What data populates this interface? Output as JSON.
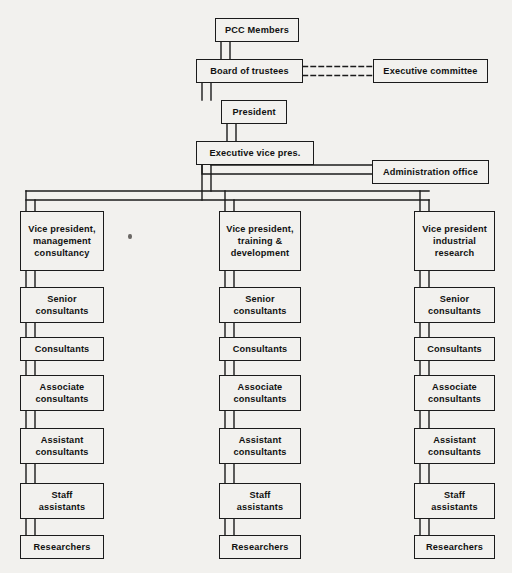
{
  "chart_data": {
    "type": "diagram",
    "diagram_kind": "organization-chart",
    "background_color": "#f2f1ee",
    "line_color": "#1b1b1b",
    "text_color": "#111111",
    "nodes": [
      {
        "id": "pcc_members",
        "label": "PCC Members",
        "x": 215,
        "y": 18,
        "w": 84,
        "h": 24
      },
      {
        "id": "board_trustees",
        "label": "Board of trustees",
        "x": 196,
        "y": 59,
        "w": 107,
        "h": 24
      },
      {
        "id": "exec_committee",
        "label": "Executive committee",
        "x": 373,
        "y": 59,
        "w": 115,
        "h": 24
      },
      {
        "id": "president",
        "label": "President",
        "x": 221,
        "y": 100,
        "w": 66,
        "h": 24
      },
      {
        "id": "exec_vice_pres",
        "label": "Executive vice pres.",
        "x": 196,
        "y": 141,
        "w": 118,
        "h": 24
      },
      {
        "id": "admin_office",
        "label": "Administration office",
        "x": 372,
        "y": 160,
        "w": 117,
        "h": 24
      },
      {
        "id": "vp_mgmt",
        "label": "Vice president,\nmanagement\nconsultancy",
        "x": 20,
        "y": 211,
        "w": 84,
        "h": 60
      },
      {
        "id": "vp_training",
        "label": "Vice president,\ntraining &\ndevelopment",
        "x": 219,
        "y": 211,
        "w": 82,
        "h": 60
      },
      {
        "id": "vp_research",
        "label": "Vice president\nindustrial\nresearch",
        "x": 414,
        "y": 211,
        "w": 81,
        "h": 60
      },
      {
        "id": "sc_l",
        "label": "Senior\nconsultants",
        "x": 20,
        "y": 287,
        "w": 84,
        "h": 36
      },
      {
        "id": "sc_m",
        "label": "Senior\nconsultants",
        "x": 219,
        "y": 287,
        "w": 82,
        "h": 36
      },
      {
        "id": "sc_r",
        "label": "Senior\nconsultants",
        "x": 414,
        "y": 287,
        "w": 81,
        "h": 36
      },
      {
        "id": "c_l",
        "label": "Consultants",
        "x": 20,
        "y": 337,
        "w": 84,
        "h": 24
      },
      {
        "id": "c_m",
        "label": "Consultants",
        "x": 219,
        "y": 337,
        "w": 82,
        "h": 24
      },
      {
        "id": "c_r",
        "label": "Consultants",
        "x": 414,
        "y": 337,
        "w": 81,
        "h": 24
      },
      {
        "id": "ac_l",
        "label": "Associate\nconsultants",
        "x": 20,
        "y": 375,
        "w": 84,
        "h": 36
      },
      {
        "id": "ac_m",
        "label": "Associate\nconsultants",
        "x": 219,
        "y": 375,
        "w": 82,
        "h": 36
      },
      {
        "id": "ac_r",
        "label": "Associate\nconsultants",
        "x": 414,
        "y": 375,
        "w": 81,
        "h": 36
      },
      {
        "id": "as_l",
        "label": "Assistant\nconsultants",
        "x": 20,
        "y": 428,
        "w": 84,
        "h": 36
      },
      {
        "id": "as_m",
        "label": "Assistant\nconsultants",
        "x": 219,
        "y": 428,
        "w": 82,
        "h": 36
      },
      {
        "id": "as_r",
        "label": "Assistant\nconsultants",
        "x": 414,
        "y": 428,
        "w": 81,
        "h": 36
      },
      {
        "id": "sa_l",
        "label": "Staff\nassistants",
        "x": 20,
        "y": 483,
        "w": 84,
        "h": 36
      },
      {
        "id": "sa_m",
        "label": "Staff\nassistants",
        "x": 219,
        "y": 483,
        "w": 82,
        "h": 36
      },
      {
        "id": "sa_r",
        "label": "Staff\nassistants",
        "x": 414,
        "y": 483,
        "w": 81,
        "h": 36
      },
      {
        "id": "r_l",
        "label": "Researchers",
        "x": 20,
        "y": 535,
        "w": 84,
        "h": 24
      },
      {
        "id": "r_m",
        "label": "Researchers",
        "x": 219,
        "y": 535,
        "w": 82,
        "h": 24
      },
      {
        "id": "r_r",
        "label": "Researchers",
        "x": 414,
        "y": 535,
        "w": 81,
        "h": 24
      }
    ],
    "connectors": [
      {
        "from": "pcc_members",
        "to": "board_trustees",
        "style": "ribbon-vertical"
      },
      {
        "from": "board_trustees",
        "to": "exec_committee",
        "style": "ribbon-horizontal-dashed"
      },
      {
        "from": "board_trustees",
        "to": "president",
        "style": "ribbon-vertical"
      },
      {
        "from": "president",
        "to": "exec_vice_pres",
        "style": "ribbon-vertical"
      },
      {
        "from": "exec_vice_pres",
        "to": "admin_office",
        "style": "ribbon-elbow"
      },
      {
        "from": "exec_vice_pres",
        "to": "vp_mgmt",
        "style": "ribbon-bus"
      },
      {
        "from": "exec_vice_pres",
        "to": "vp_training",
        "style": "ribbon-bus"
      },
      {
        "from": "exec_vice_pres",
        "to": "vp_research",
        "style": "ribbon-bus"
      },
      {
        "from": "vp_mgmt",
        "to": "sc_l",
        "style": "ribbon-vertical"
      },
      {
        "from": "sc_l",
        "to": "c_l",
        "style": "ribbon-vertical"
      },
      {
        "from": "c_l",
        "to": "ac_l",
        "style": "ribbon-vertical"
      },
      {
        "from": "ac_l",
        "to": "as_l",
        "style": "ribbon-vertical"
      },
      {
        "from": "as_l",
        "to": "sa_l",
        "style": "ribbon-vertical"
      },
      {
        "from": "sa_l",
        "to": "r_l",
        "style": "ribbon-vertical"
      },
      {
        "from": "vp_training",
        "to": "sc_m",
        "style": "ribbon-vertical"
      },
      {
        "from": "sc_m",
        "to": "c_m",
        "style": "ribbon-vertical"
      },
      {
        "from": "c_m",
        "to": "ac_m",
        "style": "ribbon-vertical"
      },
      {
        "from": "ac_m",
        "to": "as_m",
        "style": "ribbon-vertical"
      },
      {
        "from": "as_m",
        "to": "sa_m",
        "style": "ribbon-vertical"
      },
      {
        "from": "sa_m",
        "to": "r_m",
        "style": "ribbon-vertical"
      },
      {
        "from": "vp_research",
        "to": "sc_r",
        "style": "ribbon-vertical"
      },
      {
        "from": "sc_r",
        "to": "c_r",
        "style": "ribbon-vertical"
      },
      {
        "from": "c_r",
        "to": "ac_r",
        "style": "ribbon-vertical"
      },
      {
        "from": "ac_r",
        "to": "as_r",
        "style": "ribbon-vertical"
      },
      {
        "from": "as_r",
        "to": "sa_r",
        "style": "ribbon-vertical"
      },
      {
        "from": "sa_r",
        "to": "r_r",
        "style": "ribbon-vertical"
      }
    ],
    "columns": [
      {
        "name": "management consultancy",
        "head": "Vice president, management consultancy",
        "chain": [
          "Senior consultants",
          "Consultants",
          "Associate consultants",
          "Assistant consultants",
          "Staff assistants",
          "Researchers"
        ]
      },
      {
        "name": "training & development",
        "head": "Vice president, training & development",
        "chain": [
          "Senior consultants",
          "Consultants",
          "Associate consultants",
          "Assistant consultants",
          "Staff assistants",
          "Researchers"
        ]
      },
      {
        "name": "industrial research",
        "head": "Vice president industrial research",
        "chain": [
          "Senior consultants",
          "Consultants",
          "Associate consultants",
          "Assistant consultants",
          "Staff assistants",
          "Researchers"
        ]
      }
    ],
    "artifacts": [
      {
        "name": "scan-speck",
        "x": 128,
        "y": 234
      }
    ]
  }
}
